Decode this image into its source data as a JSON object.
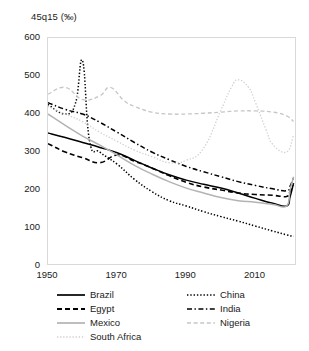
{
  "chart_data": {
    "type": "line",
    "title": "45q15 (‰)",
    "xlabel": "",
    "ylabel": "45q15 (‰)",
    "xlim": [
      1950,
      2022
    ],
    "ylim": [
      0,
      600
    ],
    "yticks": [
      0,
      100,
      200,
      300,
      400,
      500,
      600
    ],
    "xticks": [
      1950,
      1970,
      1990,
      2010
    ],
    "grid": false,
    "legend_position": "bottom",
    "series": [
      {
        "name": "Brazil",
        "style": "solid",
        "color": "#000000",
        "x": [
          1950,
          1955,
          1960,
          1965,
          1970,
          1975,
          1980,
          1985,
          1990,
          1995,
          2000,
          2005,
          2010,
          2015,
          2019,
          2020,
          2021
        ],
        "values": [
          350,
          338,
          325,
          312,
          298,
          278,
          258,
          240,
          226,
          215,
          205,
          192,
          178,
          165,
          158,
          182,
          218
        ]
      },
      {
        "name": "China",
        "style": "dotted",
        "color": "#000000",
        "x": [
          1950,
          1955,
          1958,
          1960,
          1962,
          1965,
          1970,
          1975,
          1980,
          1985,
          1990,
          1995,
          2000,
          2005,
          2010,
          2015,
          2019,
          2021
        ],
        "values": [
          425,
          400,
          430,
          540,
          330,
          300,
          268,
          228,
          196,
          172,
          158,
          143,
          130,
          118,
          105,
          92,
          82,
          78
        ]
      },
      {
        "name": "Egypt",
        "style": "dashed",
        "color": "#000000",
        "x": [
          1950,
          1955,
          1960,
          1965,
          1970,
          1975,
          1980,
          1985,
          1990,
          1995,
          2000,
          2005,
          2010,
          2015,
          2019,
          2020,
          2021
        ],
        "values": [
          322,
          300,
          285,
          272,
          292,
          276,
          258,
          238,
          220,
          208,
          200,
          192,
          188,
          186,
          183,
          196,
          212
        ]
      },
      {
        "name": "India",
        "style": "dashdot",
        "color": "#000000",
        "x": [
          1950,
          1955,
          1960,
          1965,
          1970,
          1975,
          1980,
          1985,
          1990,
          1995,
          2000,
          2005,
          2010,
          2015,
          2019,
          2020,
          2021
        ],
        "values": [
          430,
          412,
          400,
          378,
          352,
          325,
          300,
          280,
          262,
          248,
          235,
          222,
          212,
          203,
          198,
          210,
          232
        ]
      },
      {
        "name": "Mexico",
        "style": "solid",
        "color": "#b3b3b3",
        "x": [
          1950,
          1955,
          1960,
          1965,
          1970,
          1975,
          1980,
          1985,
          1990,
          1995,
          2000,
          2005,
          2010,
          2015,
          2019,
          2020,
          2021
        ],
        "values": [
          400,
          370,
          342,
          318,
          292,
          265,
          242,
          222,
          205,
          192,
          180,
          172,
          168,
          162,
          158,
          200,
          235
        ]
      },
      {
        "name": "Nigeria",
        "style": "dashed-light",
        "color": "#c6c6c6",
        "x": [
          1950,
          1955,
          1960,
          1965,
          1968,
          1972,
          1975,
          1980,
          1985,
          1990,
          1995,
          2000,
          2005,
          2010,
          2015,
          2019,
          2021
        ],
        "values": [
          452,
          470,
          438,
          448,
          470,
          435,
          420,
          405,
          400,
          400,
          402,
          405,
          408,
          408,
          405,
          395,
          380
        ]
      },
      {
        "name": "South Africa",
        "style": "dotted-light",
        "color": "#cfcfcf",
        "x": [
          1950,
          1955,
          1960,
          1965,
          1970,
          1975,
          1980,
          1985,
          1990,
          1995,
          2000,
          2003,
          2005,
          2008,
          2010,
          2013,
          2015,
          2019,
          2021
        ],
        "values": [
          420,
          400,
          380,
          352,
          328,
          305,
          288,
          272,
          278,
          310,
          410,
          470,
          490,
          470,
          430,
          360,
          320,
          300,
          345
        ]
      }
    ]
  },
  "axes": {
    "title": "45q15 (‰)",
    "yticks": [
      "600",
      "500",
      "400",
      "300",
      "200",
      "100",
      "0"
    ],
    "xticks": [
      "1950",
      "1970",
      "1990",
      "2010"
    ]
  },
  "legend": {
    "left_column": [
      {
        "label": "Brazil",
        "style": "solid",
        "color": "#000000"
      },
      {
        "label": "Egypt",
        "style": "dashed",
        "color": "#000000"
      },
      {
        "label": "Mexico",
        "style": "solid",
        "color": "#b3b3b3"
      },
      {
        "label": "South Africa",
        "style": "dotted-light",
        "color": "#cfcfcf"
      }
    ],
    "right_column": [
      {
        "label": "China",
        "style": "dotted",
        "color": "#000000"
      },
      {
        "label": "India",
        "style": "dashdot",
        "color": "#000000"
      },
      {
        "label": "Nigeria",
        "style": "dashed-light",
        "color": "#c6c6c6"
      }
    ]
  }
}
